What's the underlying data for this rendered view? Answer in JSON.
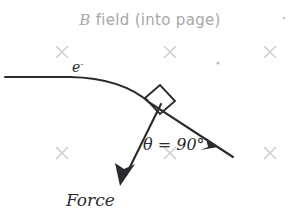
{
  "canvas": {
    "width": 300,
    "height": 220,
    "background": "#ffffff"
  },
  "title": {
    "symbol": "B",
    "rest": " field (into page)",
    "full": "B field (into page)",
    "color": "#a8a8a8",
    "x": 150,
    "y": 25
  },
  "labels": {
    "electron": {
      "base": "e",
      "charge": "-",
      "full": "e-",
      "color": "#2b2b2f",
      "x": 72,
      "y": 72
    },
    "angle": {
      "text": "θ = 90°",
      "color": "#2b2b2f",
      "x": 143,
      "y": 150
    },
    "force": {
      "text": "Force",
      "color": "#2b2b2f",
      "x": 66,
      "y": 205
    }
  },
  "field": {
    "marker_glyph": "×",
    "marker_color": "#cfcfcf",
    "marker_size": 11,
    "crosses": [
      {
        "x": 62,
        "y": 52
      },
      {
        "x": 170,
        "y": 52
      },
      {
        "x": 270,
        "y": 52
      },
      {
        "x": 62,
        "y": 153
      },
      {
        "x": 170,
        "y": 153
      },
      {
        "x": 270,
        "y": 153
      }
    ],
    "specks": [
      {
        "x": 218,
        "y": 63,
        "r": 1.5
      },
      {
        "x": 284,
        "y": 18,
        "r": 1.2
      }
    ]
  },
  "trajectory": {
    "name": "electron-path",
    "color": "#2b2b2f",
    "path": "M 5 77 L 70 77 Q 120 78 150 103 L 233 157",
    "arrow_tip": {
      "x": 216,
      "y": 146
    },
    "arrow_angle_deg": 33
  },
  "force_vector": {
    "name": "force-arrow",
    "color": "#2b2b2f",
    "start": {
      "x": 161,
      "y": 104
    },
    "end": {
      "x": 122,
      "y": 183
    },
    "angle_deg": 116
  },
  "right_angle_marker": {
    "name": "right-angle-square",
    "color": "#2b2b2f",
    "size": 20,
    "vertex": {
      "x": 156,
      "y": 108
    }
  }
}
